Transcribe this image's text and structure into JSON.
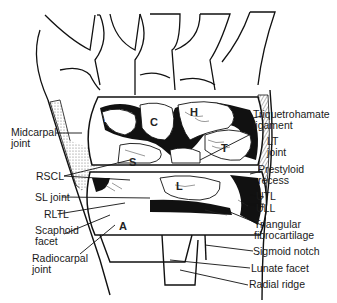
{
  "figure": {
    "type": "anatomical-diagram",
    "line_color": "#111111",
    "background": "#ffffff",
    "stipple_color": "#bdbdbd"
  },
  "bone_letters": {
    "B": "B",
    "C": "C",
    "H": "H",
    "T": "T",
    "S": "S",
    "L": "L",
    "A": "A"
  },
  "labels_left": {
    "midcarpal_joint": "Midcarpal\njoint",
    "rscl": "RSCL",
    "sl_joint": "SL joint",
    "rltl": "RLTL",
    "scaphoid_facet": "Scaphoid\nfacet",
    "radiocarpal_joint": "Radiocarpal\njoint"
  },
  "labels_right": {
    "triquetrohamate_ligament": "Triquetrohamate\nligament",
    "lt_joint": "LT\njoint",
    "prestyloid_recess": "Prestyloid\nrecess",
    "utl": "UTL",
    "ull": "ULL",
    "triangular_fibrocartilage": "Triangular\nfibrocartilage",
    "sigmoid_notch": "Sigmoid notch",
    "lunate_facet": "Lunate facet",
    "radial_ridge": "Radial ridge"
  }
}
